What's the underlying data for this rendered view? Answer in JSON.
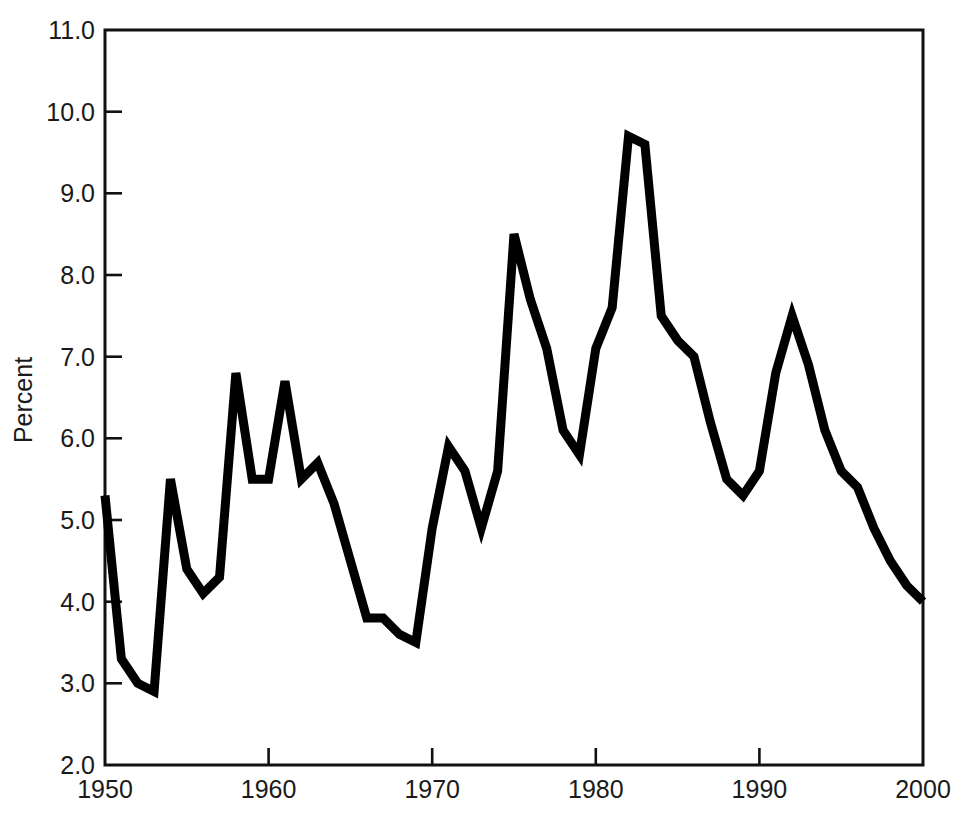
{
  "chart_data": {
    "type": "line",
    "title": "",
    "subtitle": "",
    "xlabel": "",
    "ylabel": "Percent",
    "xlim": [
      1950,
      2000
    ],
    "ylim": [
      2.0,
      11.0
    ],
    "grid": false,
    "legend": "none",
    "x_ticks": [
      1950,
      1960,
      1970,
      1980,
      1990,
      2000
    ],
    "x_tick_labels": [
      "1950",
      "1960",
      "1970",
      "1980",
      "1990",
      "2000"
    ],
    "y_ticks": [
      2.0,
      3.0,
      4.0,
      5.0,
      6.0,
      7.0,
      8.0,
      9.0,
      10.0,
      11.0
    ],
    "y_tick_labels": [
      "2.0",
      "3.0",
      "4.0",
      "5.0",
      "6.0",
      "7.0",
      "8.0",
      "9.0",
      "10.0",
      "11.0"
    ],
    "series": [
      {
        "name": "Percent",
        "color": "#000000",
        "x": [
          1950,
          1951,
          1952,
          1953,
          1954,
          1955,
          1956,
          1957,
          1958,
          1959,
          1960,
          1961,
          1962,
          1963,
          1964,
          1965,
          1966,
          1967,
          1968,
          1969,
          1970,
          1971,
          1972,
          1973,
          1974,
          1975,
          1976,
          1977,
          1978,
          1979,
          1980,
          1981,
          1982,
          1983,
          1984,
          1985,
          1986,
          1987,
          1988,
          1989,
          1990,
          1991,
          1992,
          1993,
          1994,
          1995,
          1996,
          1997,
          1998,
          1999,
          2000
        ],
        "values": [
          5.3,
          3.3,
          3.0,
          2.9,
          5.5,
          4.4,
          4.1,
          4.3,
          6.8,
          5.5,
          5.5,
          6.7,
          5.5,
          5.7,
          5.2,
          4.5,
          3.8,
          3.8,
          3.6,
          3.5,
          4.9,
          5.9,
          5.6,
          4.9,
          5.6,
          8.5,
          7.7,
          7.1,
          6.1,
          5.8,
          7.1,
          7.6,
          9.7,
          9.6,
          7.5,
          7.2,
          7.0,
          6.2,
          5.5,
          5.3,
          5.6,
          6.8,
          7.5,
          6.9,
          6.1,
          5.6,
          5.4,
          4.9,
          4.5,
          4.2,
          4.0
        ]
      }
    ]
  },
  "axes": {
    "y_title": "Percent"
  }
}
